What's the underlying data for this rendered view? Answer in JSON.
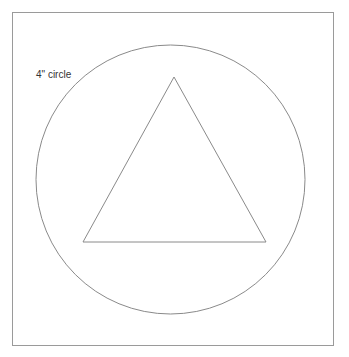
{
  "diagram": {
    "label": "4\" circle",
    "frame": {
      "x": 12,
      "y": 12,
      "width": 322,
      "height": 334,
      "stroke": "#9a9a9a"
    },
    "circle": {
      "cx": 170.5,
      "cy": 179.5,
      "r": 134.5,
      "stroke": "#8a8a8a"
    },
    "triangle": {
      "points": "174,77 83,242 266,242",
      "stroke": "#8a8a8a"
    }
  }
}
